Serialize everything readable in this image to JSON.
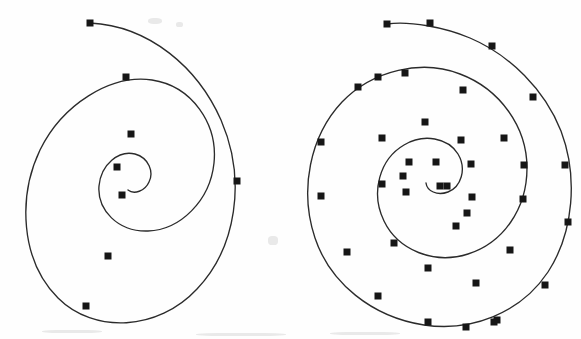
{
  "figure": {
    "background_color": "#fefefe",
    "stroke_color": "#2b2b2b",
    "marker_color": "#161616",
    "stroke_width": 1.35,
    "width": 581,
    "height": 339
  },
  "chart_data": {
    "type": "scatter",
    "subtitle": "Left: coarse sampling (8 markers). Right: fine sampling (40 markers).",
    "xlabel": "",
    "ylabel": "",
    "xlim": [
      0,
      581
    ],
    "ylim": [
      0,
      339
    ],
    "grid": false,
    "legend": "none",
    "annotations": [],
    "series": [
      {
        "name": "spiral-left-coarse",
        "marker": "square",
        "marker_size": 7,
        "marker_count": 8,
        "line": "solid",
        "center": [
          118,
          183
        ],
        "turns": 2.6,
        "outer_radius_x": 120,
        "outer_radius_y": 155,
        "path": "M 90 23 C 150 26 198 68 221 120 C 247 180 236 248 197 289 C 158 331 94 334 58 298 C 20 260 18 196 40 150 C 62 105 110 74 152 80 C 192 86 218 124 214 163 C 210 201 180 230 148 231 C 118 232 97 210 99 186 C 101 164 119 150 135 154 C 149 158 154 172 149 182 C 145 191 134 195 128 190",
        "points": [
          {
            "x": 90,
            "y": 23,
            "index": 0,
            "label": "start"
          },
          {
            "x": 126,
            "y": 77,
            "index": 1,
            "label": ""
          },
          {
            "x": 131,
            "y": 134,
            "index": 2,
            "label": ""
          },
          {
            "x": 117,
            "y": 167,
            "index": 3,
            "label": ""
          },
          {
            "x": 122,
            "y": 195,
            "index": 4,
            "label": "end"
          },
          {
            "x": 108,
            "y": 256,
            "index": 5,
            "label": ""
          },
          {
            "x": 86,
            "y": 306,
            "index": 6,
            "label": ""
          },
          {
            "x": 237,
            "y": 181,
            "index": 7,
            "label": ""
          }
        ]
      },
      {
        "name": "spiral-right-fine",
        "marker": "square",
        "marker_size": 7,
        "marker_count": 40,
        "line": "solid",
        "center": [
          446,
          183
        ],
        "turns": 2.9,
        "outer_radius_x": 128,
        "outer_radius_y": 155,
        "path": "M 387 24 C 410 21 444 27 470 38 C 510 55 545 90 561 131 C 578 176 574 232 548 272 C 520 314 470 332 424 325 C 372 317 330 283 315 238 C 299 190 310 136 342 102 C 373 70 422 59 460 74 C 500 89 527 127 527 168 C 527 209 503 243 468 254 C 434 265 398 250 384 221 C 370 192 380 159 404 145 C 424 133 448 138 458 154 C 467 169 461 187 448 192 C 437 196 427 191 426 183",
        "points": [
          {
            "x": 387,
            "y": 24,
            "index": 0,
            "label": "start"
          },
          {
            "x": 430,
            "y": 23,
            "index": 1,
            "label": ""
          },
          {
            "x": 492,
            "y": 46,
            "index": 2,
            "label": ""
          },
          {
            "x": 533,
            "y": 97,
            "index": 3,
            "label": ""
          },
          {
            "x": 565,
            "y": 165,
            "index": 4,
            "label": ""
          },
          {
            "x": 568,
            "y": 222,
            "index": 5,
            "label": ""
          },
          {
            "x": 545,
            "y": 285,
            "index": 6,
            "label": ""
          },
          {
            "x": 497,
            "y": 320,
            "index": 7,
            "label": ""
          },
          {
            "x": 466,
            "y": 327,
            "index": 8,
            "label": ""
          },
          {
            "x": 428,
            "y": 322,
            "index": 9,
            "label": ""
          },
          {
            "x": 378,
            "y": 296,
            "index": 10,
            "label": ""
          },
          {
            "x": 347,
            "y": 252,
            "index": 11,
            "label": ""
          },
          {
            "x": 321,
            "y": 196,
            "index": 12,
            "label": ""
          },
          {
            "x": 321,
            "y": 142,
            "index": 13,
            "label": ""
          },
          {
            "x": 358,
            "y": 87,
            "index": 14,
            "label": ""
          },
          {
            "x": 378,
            "y": 77,
            "index": 15,
            "label": ""
          },
          {
            "x": 405,
            "y": 73,
            "index": 16,
            "label": ""
          },
          {
            "x": 463,
            "y": 90,
            "index": 17,
            "label": ""
          },
          {
            "x": 504,
            "y": 138,
            "index": 18,
            "label": ""
          },
          {
            "x": 524,
            "y": 165,
            "index": 19,
            "label": ""
          },
          {
            "x": 523,
            "y": 199,
            "index": 20,
            "label": ""
          },
          {
            "x": 510,
            "y": 250,
            "index": 21,
            "label": ""
          },
          {
            "x": 476,
            "y": 283,
            "index": 22,
            "label": ""
          },
          {
            "x": 428,
            "y": 268,
            "index": 23,
            "label": ""
          },
          {
            "x": 394,
            "y": 243,
            "index": 24,
            "label": ""
          },
          {
            "x": 382,
            "y": 184,
            "index": 25,
            "label": ""
          },
          {
            "x": 382,
            "y": 138,
            "index": 26,
            "label": ""
          },
          {
            "x": 425,
            "y": 122,
            "index": 27,
            "label": ""
          },
          {
            "x": 461,
            "y": 140,
            "index": 28,
            "label": ""
          },
          {
            "x": 471,
            "y": 164,
            "index": 29,
            "label": ""
          },
          {
            "x": 472,
            "y": 197,
            "index": 30,
            "label": ""
          },
          {
            "x": 467,
            "y": 213,
            "index": 31,
            "label": ""
          },
          {
            "x": 456,
            "y": 226,
            "index": 32,
            "label": ""
          },
          {
            "x": 436,
            "y": 162,
            "index": 33,
            "label": ""
          },
          {
            "x": 409,
            "y": 162,
            "index": 34,
            "label": ""
          },
          {
            "x": 403,
            "y": 176,
            "index": 35,
            "label": ""
          },
          {
            "x": 406,
            "y": 192,
            "index": 36,
            "label": ""
          },
          {
            "x": 440,
            "y": 186,
            "index": 37,
            "label": "end"
          },
          {
            "x": 447,
            "y": 186,
            "index": 38,
            "label": ""
          },
          {
            "x": 494,
            "y": 322,
            "index": 39,
            "label": ""
          }
        ]
      }
    ]
  }
}
